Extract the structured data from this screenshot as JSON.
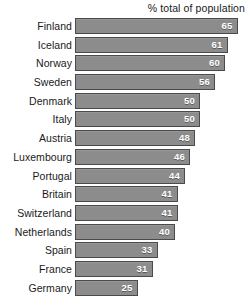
{
  "chart_data": {
    "type": "bar",
    "orientation": "horizontal",
    "title": "",
    "subtitle": "",
    "axis_header": "% total of population",
    "xlabel": "",
    "ylabel": "",
    "xlim": [
      0,
      70
    ],
    "grid": false,
    "legend": false,
    "value_label_position": "inside-right",
    "categories": [
      "Finland",
      "Iceland",
      "Norway",
      "Sweden",
      "Denmark",
      "Italy",
      "Austria",
      "Luxembourg",
      "Portugal",
      "Britain",
      "Switzerland",
      "Netherlands",
      "Spain",
      "France",
      "Germany"
    ],
    "values": [
      65,
      61,
      60,
      56,
      50,
      50,
      48,
      46,
      44,
      41,
      41,
      40,
      33,
      31,
      25
    ],
    "bars": [
      {
        "label": "Finland",
        "value": 65,
        "value_text": "65"
      },
      {
        "label": "Iceland",
        "value": 61,
        "value_text": "61"
      },
      {
        "label": "Norway",
        "value": 60,
        "value_text": "60"
      },
      {
        "label": "Sweden",
        "value": 56,
        "value_text": "56"
      },
      {
        "label": "Denmark",
        "value": 50,
        "value_text": "50"
      },
      {
        "label": "Italy",
        "value": 50,
        "value_text": "50"
      },
      {
        "label": "Austria",
        "value": 48,
        "value_text": "48"
      },
      {
        "label": "Luxembourg",
        "value": 46,
        "value_text": "46"
      },
      {
        "label": "Portugal",
        "value": 44,
        "value_text": "44"
      },
      {
        "label": "Britain",
        "value": 41,
        "value_text": "41"
      },
      {
        "label": "Switzerland",
        "value": 41,
        "value_text": "41"
      },
      {
        "label": "Netherlands",
        "value": 40,
        "value_text": "40"
      },
      {
        "label": "Spain",
        "value": 33,
        "value_text": "33"
      },
      {
        "label": "France",
        "value": 31,
        "value_text": "31"
      },
      {
        "label": "Germany",
        "value": 25,
        "value_text": "25"
      }
    ],
    "colors": {
      "bar_fill": "#8c8c8c",
      "bar_border": "#4a4a4a",
      "value_text": "#ffffff",
      "label_text": "#1a1a1a",
      "background": "#ffffff"
    }
  },
  "layout": {
    "bar_origin_px": 75,
    "px_per_unit": 2.5,
    "bar_height_px": 16,
    "row_pitch_px": 18.7
  }
}
